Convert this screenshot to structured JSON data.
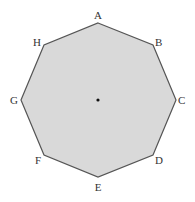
{
  "diagram": {
    "shape": "regular octagon",
    "fill": "#d9d9d9",
    "stroke": "#555555",
    "vertices": [
      {
        "label": "A",
        "x": 98,
        "y": 23,
        "lx": 98,
        "ly": 19,
        "anchor": "middle"
      },
      {
        "label": "B",
        "x": 153,
        "y": 45,
        "lx": 155,
        "ly": 46,
        "anchor": "start"
      },
      {
        "label": "C",
        "x": 176,
        "y": 100,
        "lx": 178,
        "ly": 104,
        "anchor": "start"
      },
      {
        "label": "D",
        "x": 153,
        "y": 155,
        "lx": 155,
        "ly": 164,
        "anchor": "start"
      },
      {
        "label": "E",
        "x": 98,
        "y": 177,
        "lx": 98,
        "ly": 191,
        "anchor": "middle"
      },
      {
        "label": "F",
        "x": 44,
        "y": 155,
        "lx": 41,
        "ly": 164,
        "anchor": "end"
      },
      {
        "label": "G",
        "x": 21,
        "y": 100,
        "lx": 18,
        "ly": 104,
        "anchor": "end"
      },
      {
        "label": "H",
        "x": 44,
        "y": 45,
        "lx": 41,
        "ly": 46,
        "anchor": "end"
      }
    ],
    "center": {
      "x": 98,
      "y": 100
    }
  }
}
